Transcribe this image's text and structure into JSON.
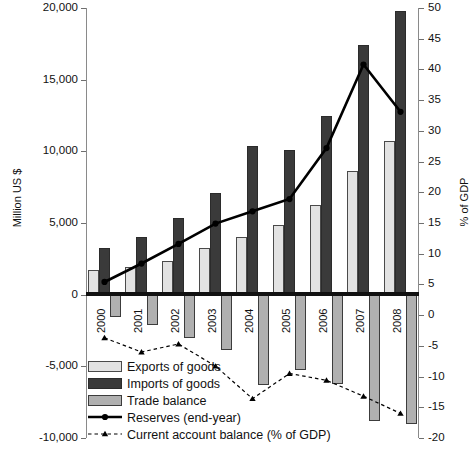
{
  "chart_data": {
    "type": "bar",
    "title": "",
    "categories": [
      "2000",
      "2001",
      "2002",
      "2003",
      "2004",
      "2005",
      "2006",
      "2007",
      "2008"
    ],
    "left_axis": {
      "label": "Million US $",
      "ticks": [
        20000,
        15000,
        10000,
        5000,
        0,
        -5000,
        -10000
      ],
      "tick_labels": [
        "20,000",
        "15,000",
        "10,000",
        "5,000",
        "0",
        "-5,000",
        "-10,000"
      ],
      "ylim": [
        -10000,
        20000
      ]
    },
    "right_axis": {
      "label": "% of GDP",
      "ticks": [
        50,
        45,
        40,
        35,
        30,
        25,
        20,
        15,
        10,
        5,
        0,
        -5,
        -10,
        -15,
        -20
      ],
      "tick_labels": [
        "50",
        "45",
        "40",
        "35",
        "30",
        "25",
        "20",
        "15",
        "10",
        "5",
        "0",
        "-5",
        "-10",
        "-15",
        "-20"
      ],
      "ylim": [
        -20,
        50
      ]
    },
    "grid": false,
    "legend_position": "bottom-left",
    "series": [
      {
        "name": "Exports of goods",
        "type": "bar",
        "axis": "left",
        "unit": "Million US $",
        "color": "#e2e2e2",
        "values": [
          1700,
          1900,
          2350,
          3250,
          4050,
          4850,
          6250,
          8650,
          10750
        ]
      },
      {
        "name": "Imports of goods",
        "type": "bar",
        "axis": "left",
        "unit": "Million US $",
        "color": "#3a3a3a",
        "values": [
          3250,
          4050,
          5350,
          7100,
          10350,
          10100,
          12500,
          17450,
          19800
        ]
      },
      {
        "name": "Trade balance",
        "type": "bar",
        "axis": "left",
        "unit": "Million US $",
        "color": "#b0b0b0",
        "values": [
          -1550,
          -2150,
          -3000,
          -3850,
          -6300,
          -5250,
          -6250,
          -8800,
          -9050
        ]
      },
      {
        "name": "Reserves (end-year)",
        "type": "line",
        "axis": "right",
        "unit": "% of GDP",
        "color": "#000000",
        "values": [
          5.4,
          8.4,
          11.6,
          14.9,
          16.9,
          18.9,
          27.2,
          40.8,
          33.1
        ]
      },
      {
        "name": "Current account balance (% of GDP)",
        "type": "line",
        "axis": "right",
        "unit": "% of GDP",
        "color": "#000000",
        "dashed": true,
        "values": [
          -3.7,
          -6.0,
          -4.7,
          -8.3,
          -13.6,
          -9.5,
          -10.6,
          -13.2,
          -16.0
        ]
      }
    ]
  },
  "legend": {
    "items": [
      {
        "label": "Exports of goods",
        "key": "exports"
      },
      {
        "label": "Imports of goods",
        "key": "imports"
      },
      {
        "label": "Trade balance",
        "key": "trade"
      },
      {
        "label": "Reserves (end-year)",
        "key": "reserves-line"
      },
      {
        "label": "Current account balance (% of GDP)",
        "key": "current-account-line"
      }
    ]
  }
}
